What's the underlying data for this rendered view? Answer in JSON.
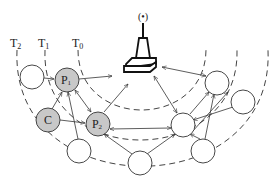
{
  "diagram": {
    "type": "wireless-network-topology",
    "colors": {
      "line": "#333333",
      "highlight_node_fill": "#c8c8c8",
      "plain_node_fill": "#ffffff",
      "ring_dash": "#444444"
    },
    "rings": [
      {
        "id": "T0",
        "label": "T",
        "sub": "0"
      },
      {
        "id": "T1",
        "label": "T",
        "sub": "1"
      },
      {
        "id": "T2",
        "label": "T",
        "sub": "2"
      }
    ],
    "sink": {
      "id": "base-station",
      "glyph": "(•)"
    },
    "nodes": [
      {
        "id": "n-left",
        "label": "",
        "highlight": false
      },
      {
        "id": "P1",
        "label": "P",
        "sub": "1",
        "highlight": true
      },
      {
        "id": "C",
        "label": "C",
        "highlight": true
      },
      {
        "id": "P2",
        "label": "P",
        "sub": "2",
        "highlight": true
      },
      {
        "id": "n-bottom-left",
        "label": "",
        "highlight": false
      },
      {
        "id": "n-bottom-mid",
        "label": "",
        "highlight": false
      },
      {
        "id": "n-mid-right",
        "label": "",
        "highlight": false
      },
      {
        "id": "n-right-top",
        "label": "",
        "highlight": false
      },
      {
        "id": "n-far-right",
        "label": "",
        "highlight": false
      },
      {
        "id": "n-bottom-right",
        "label": "",
        "highlight": false
      }
    ]
  }
}
